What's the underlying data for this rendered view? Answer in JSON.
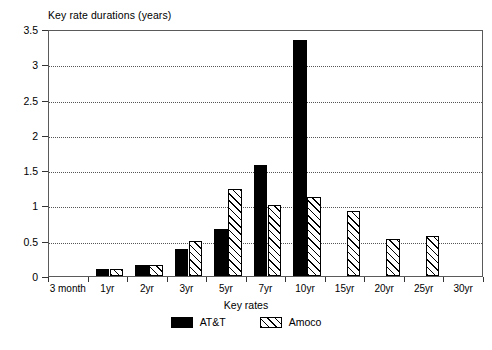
{
  "chart_data": {
    "type": "bar",
    "title": "Key rate durations (years)",
    "xlabel": "Key rates",
    "ylabel": "",
    "categories": [
      "3 month",
      "1yr",
      "2yr",
      "3yr",
      "5yr",
      "7yr",
      "10yr",
      "15yr",
      "20yr",
      "25yr",
      "30yr"
    ],
    "series": [
      {
        "name": "AT&T",
        "style": "solid-black",
        "color": "#000000",
        "values": [
          0,
          0.1,
          0.16,
          0.38,
          0.67,
          1.57,
          3.35,
          0,
          0,
          0,
          0
        ]
      },
      {
        "name": "Amoco",
        "style": "diagonal-hatch",
        "color": "#ffffff",
        "values": [
          0,
          0.1,
          0.16,
          0.5,
          1.24,
          1.0,
          1.12,
          0.92,
          0.52,
          0.57,
          0
        ]
      }
    ],
    "ylim": [
      0,
      3.5
    ],
    "yticks": [
      0,
      0.5,
      1,
      1.5,
      2,
      2.5,
      3,
      3.5
    ],
    "ytick_labels": [
      "0",
      "0.5",
      "1",
      "1.5",
      "2",
      "2.5",
      "3",
      "3.5"
    ],
    "grid": true,
    "grid_style": "dotted",
    "legend_position": "bottom-center"
  },
  "legend": {
    "entries": [
      {
        "label": "AT&T"
      },
      {
        "label": "Amoco"
      }
    ]
  }
}
